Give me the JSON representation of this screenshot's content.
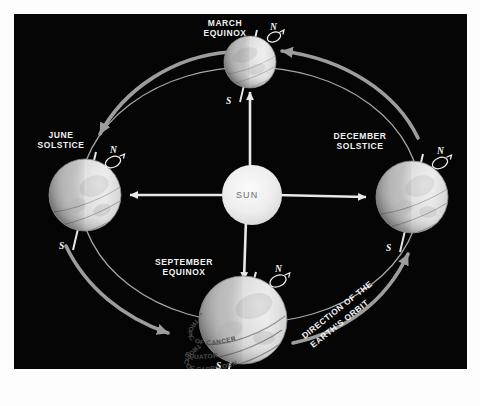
{
  "diagram": {
    "background_color": "#050505",
    "frame_color": "#fdfdfd",
    "orbit_color": "#b9b9b9",
    "arrow_color": "#9a9a9a",
    "ray_color": "#e8e8e8",
    "globe_color": "#cfcfcf",
    "label_color": "#f2f2f2"
  },
  "sun": {
    "label": "SUN",
    "cx": 238,
    "cy": 181,
    "r": 30,
    "color": "#ececec"
  },
  "positions": [
    {
      "id": "march-equinox",
      "label": "MARCH\nEQUINOX",
      "label_x": 192,
      "label_y": 5,
      "cx": 236,
      "cy": 48,
      "r": 26,
      "tilt": -23.5,
      "north_label": "N",
      "south_label": "S"
    },
    {
      "id": "june-solstice",
      "label": "JUNE\nSOLSTICE",
      "label_x": 23,
      "label_y": 117,
      "cx": 71,
      "cy": 181,
      "r": 36,
      "tilt": -23.5,
      "north_label": "N",
      "south_label": "S"
    },
    {
      "id": "december-solstice",
      "label": "DECEMBER\nSOLSTICE",
      "label_x": 310,
      "label_y": 117,
      "cx": 398,
      "cy": 183,
      "r": 36,
      "tilt": -23.5,
      "north_label": "N",
      "south_label": "S"
    },
    {
      "id": "september-equinox",
      "label": "SEPTEMBER\nEQUINOX",
      "label_x": 138,
      "label_y": 244,
      "cx": 229,
      "cy": 306,
      "r": 44,
      "tilt": -23.5,
      "north_label": "N",
      "south_label": "S"
    }
  ],
  "latitude_labels": [
    {
      "text": "TROPIC OF CANCER",
      "on": "september-equinox"
    },
    {
      "text": "EQUATOR",
      "on": "september-equinox"
    },
    {
      "text": "TROPIC OF CAPRICORN",
      "on": "september-equinox"
    }
  ],
  "orbit_direction": {
    "text": "DIRECTION OF THE\nEARTH'S ORBIT",
    "line1": "DIRECTION OF THE",
    "line2": "EARTH'S ORBIT"
  },
  "sun_rays": [
    {
      "id": "ray-to-june",
      "direction": "left"
    },
    {
      "id": "ray-to-december",
      "direction": "right"
    },
    {
      "id": "ray-to-march",
      "direction": "up"
    },
    {
      "id": "ray-to-september",
      "direction": "down"
    }
  ]
}
